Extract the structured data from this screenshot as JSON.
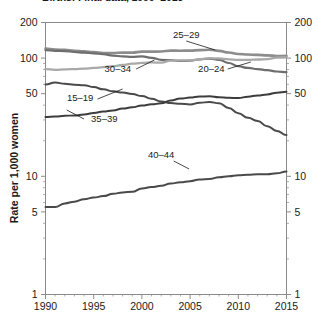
{
  "chart_data": {
    "type": "line",
    "title": "Births: Final data, 1990–2015",
    "xlabel": "",
    "ylabel": "Rate per 1,000 women",
    "x": [
      1990,
      1991,
      1992,
      1993,
      1994,
      1995,
      1996,
      1997,
      1998,
      1999,
      2000,
      2001,
      2002,
      2003,
      2004,
      2005,
      2006,
      2007,
      2008,
      2009,
      2010,
      2011,
      2012,
      2013,
      2014,
      2015
    ],
    "xlim": [
      1990,
      2015
    ],
    "ylim": [
      1,
      200
    ],
    "yscale": "log",
    "grid": false,
    "legend_position": "inline-labels",
    "ytick_labels": [
      "200",
      "100",
      "50",
      "10",
      "5",
      "1"
    ],
    "ytick_values": [
      200,
      100,
      50,
      10,
      5,
      1
    ],
    "ytick_labels_right": [
      "200",
      "100",
      "50",
      "10",
      "5",
      "1"
    ],
    "xtick_labels": [
      "1990",
      "1995",
      "2000",
      "2005",
      "2010",
      "2015"
    ],
    "xtick_values": [
      1990,
      1995,
      2000,
      2005,
      2010,
      2015
    ],
    "series": [
      {
        "name": "25–29",
        "color": "#8c8c8c",
        "width": 2.6,
        "label_x": 2004.6,
        "label_y_px": 38,
        "leader": "2004.6,41 -> 2007.6,50",
        "values": [
          120.2,
          118.2,
          117.4,
          115.5,
          113.9,
          112.2,
          110.4,
          110.4,
          111.2,
          111.2,
          113.5,
          113.4,
          113.6,
          115.6,
          115.5,
          115.6,
          116.8,
          117.5,
          115.1,
          111.5,
          108.3,
          107.2,
          106.5,
          105.5,
          104.2,
          104.3
        ]
      },
      {
        "name": "20–24",
        "color": "#6e6e6e",
        "width": 2.2,
        "label_x": 2007.2,
        "label_y_px": 72,
        "leader": "2008.9,69 -> 2011.3,62",
        "values": [
          116.5,
          115.3,
          114.6,
          112.6,
          111.1,
          109.8,
          107.8,
          104.9,
          103.4,
          102.3,
          103.3,
          100.6,
          96.5,
          96.0,
          94.6,
          95.1,
          97.7,
          98.7,
          96.7,
          90.9,
          85.3,
          82.5,
          80.7,
          79.0,
          77.0,
          76.0
        ]
      },
      {
        "name": "30–34",
        "color": "#a9a9a9",
        "width": 2.3,
        "label_x": 1997.5,
        "label_y_px": 72,
        "leader": "1999.4,69 -> 2001.3,60",
        "values": [
          80.8,
          79.5,
          80.2,
          80.8,
          81.5,
          82.5,
          83.9,
          85.3,
          87.4,
          89.6,
          91.2,
          91.9,
          91.5,
          95.1,
          95.5,
          95.8,
          97.7,
          99.9,
          99.3,
          97.5,
          96.5,
          96.4,
          97.3,
          98.0,
          100.8,
          101.5
        ]
      },
      {
        "name": "15–19",
        "color": "#4a4a4a",
        "width": 2.0,
        "label_x": 1993.6,
        "label_y_px": 101,
        "leader": "1995.4,99 -> 1998.0,89",
        "values": [
          59.9,
          62.1,
          60.7,
          59.6,
          58.9,
          56.8,
          54.4,
          52.3,
          51.1,
          49.6,
          47.7,
          45.3,
          43.0,
          41.6,
          41.1,
          40.5,
          41.9,
          42.5,
          41.5,
          37.9,
          34.2,
          31.3,
          29.4,
          26.5,
          24.2,
          22.3
        ]
      },
      {
        "name": "35–39",
        "color": "#3d3d3d",
        "width": 2.0,
        "label_x": 1996.1,
        "label_y_px": 122,
        "leader": "1994.0,119 -> 1992.2,110",
        "values": [
          31.7,
          32.0,
          32.5,
          32.7,
          33.4,
          34.3,
          35.3,
          36.1,
          37.4,
          38.3,
          39.7,
          40.6,
          41.4,
          43.8,
          45.4,
          46.3,
          47.3,
          47.5,
          46.6,
          46.1,
          45.9,
          47.2,
          48.3,
          49.3,
          51.0,
          51.8
        ]
      },
      {
        "name": "40–44",
        "color": "#4a4a4a",
        "width": 2.0,
        "label_x": 2002.0,
        "label_y_px": 158,
        "leader": "2003.3,161 -> 2004.9,169",
        "values": [
          5.5,
          5.5,
          5.9,
          6.1,
          6.4,
          6.6,
          6.8,
          7.1,
          7.3,
          7.4,
          7.9,
          8.1,
          8.3,
          8.7,
          8.9,
          9.1,
          9.4,
          9.5,
          9.8,
          10.0,
          10.2,
          10.3,
          10.4,
          10.4,
          10.6,
          11.0
        ]
      }
    ]
  },
  "axes": {
    "y_title": "Rate per 1,000 women"
  }
}
